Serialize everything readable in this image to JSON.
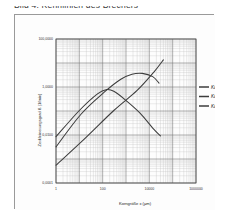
{
  "document": {
    "caption": "Bild 4:  Kennlinien des Brechers"
  },
  "figure": {
    "legend_title": ""
  },
  "chart_data": {
    "type": "line",
    "title": "",
    "xlabel": "Korngröße x  (µm)",
    "ylabel": "Zerkleinerungsgrad  ß  (1/min)",
    "xscale": "log",
    "yscale": "log",
    "xlim": [
      1,
      1000000
    ],
    "ylim": [
      0.0001,
      100.0
    ],
    "grid": true,
    "minor_grid": true,
    "legend_position": "right",
    "x_ticks": [
      1,
      100,
      10000,
      1000000
    ],
    "x_tick_labels": [
      "1",
      "100",
      "10000",
      "1000000"
    ],
    "y_ticks": [
      0.0001,
      0.01,
      1.0,
      100.0
    ],
    "y_tick_labels": [
      "0,0001",
      "0,0100",
      "1,0000",
      "100,0000"
    ],
    "series": [
      {
        "name": "Kammer 1",
        "color": "#3d3d3d",
        "points": [
          [
            1,
            0.0085
          ],
          [
            10,
            0.105
          ],
          [
            60,
            0.52
          ],
          [
            150,
            0.78
          ],
          [
            300,
            0.66
          ],
          [
            900,
            0.3
          ],
          [
            4000,
            0.082
          ],
          [
            14000,
            0.0195
          ],
          [
            30000,
            0.0092
          ]
        ]
      },
      {
        "name": "Kammer 2",
        "color": "#3d3d3d",
        "points": [
          [
            1,
            0.0032
          ],
          [
            12,
            0.075
          ],
          [
            120,
            0.62
          ],
          [
            600,
            2.1
          ],
          [
            1800,
            3.4
          ],
          [
            5000,
            3.7
          ],
          [
            14000,
            2.7
          ],
          [
            26000,
            1.45
          ]
        ]
      },
      {
        "name": "Kammer 3",
        "color": "#3d3d3d",
        "points": [
          [
            1,
            0.00055
          ],
          [
            20,
            0.0082
          ],
          [
            300,
            0.105
          ],
          [
            3000,
            0.72
          ],
          [
            16000,
            4.3
          ],
          [
            40000,
            13.5
          ]
        ]
      }
    ]
  }
}
